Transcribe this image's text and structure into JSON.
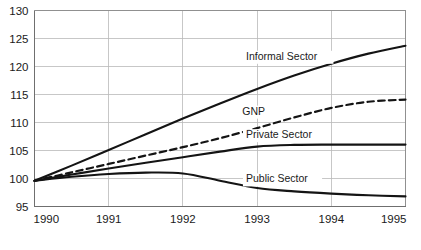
{
  "chart_data": {
    "type": "line",
    "title": "",
    "subtitle": "",
    "xlabel": "",
    "ylabel": "",
    "xlim": [
      1990,
      1995
    ],
    "ylim": [
      95,
      130
    ],
    "x": [
      1990,
      1990.5,
      1991,
      1991.5,
      1992,
      1992.5,
      1993,
      1993.5,
      1994,
      1994.5,
      1995
    ],
    "xticks": [
      "1990",
      "1991",
      "1992",
      "1993",
      "1994",
      "1995"
    ],
    "yticks": [
      "95",
      "100",
      "105",
      "110",
      "115",
      "120",
      "125",
      "130"
    ],
    "grid": true,
    "legend_position": "inline-labels",
    "index_base": 100,
    "series": [
      {
        "name": "Informal Sector",
        "style": "solid",
        "color": "#141414",
        "label_x": 1992.85,
        "label_y": 121.2,
        "values": [
          99.6,
          102.3,
          105.1,
          107.9,
          110.7,
          113.4,
          116.0,
          118.4,
          120.5,
          122.3,
          123.7
        ]
      },
      {
        "name": "GNP",
        "style": "dashed",
        "color": "#141414",
        "label_x": 1992.8,
        "label_y": 111.4,
        "values": [
          99.6,
          101.1,
          102.6,
          104.1,
          105.6,
          107.2,
          109.0,
          110.9,
          112.6,
          113.7,
          114.1
        ]
      },
      {
        "name": "Private Sector",
        "style": "solid",
        "color": "#141414",
        "label_x": 1992.85,
        "label_y": 107.2,
        "values": [
          99.6,
          100.7,
          101.8,
          102.8,
          103.8,
          104.8,
          105.7,
          106.0,
          106.05,
          106.05,
          106.05
        ]
      },
      {
        "name": "Public Sector",
        "style": "solid",
        "color": "#141414",
        "label_x": 1992.85,
        "label_y": 99.3,
        "values": [
          99.6,
          100.3,
          100.8,
          101.05,
          100.9,
          99.6,
          98.3,
          97.7,
          97.3,
          97.0,
          96.8
        ]
      }
    ]
  },
  "axes": {
    "y_tick_labels": [
      "130",
      "125",
      "120",
      "115",
      "110",
      "105",
      "100",
      "95"
    ],
    "x_tick_labels": [
      "1990",
      "1991",
      "1992",
      "1993",
      "1994",
      "1995"
    ]
  },
  "colors": {
    "line": "#141414",
    "grid": "#b9b9b9",
    "axis": "#6f6f6f",
    "background": "#ffffff",
    "text": "#1a1a1a"
  }
}
